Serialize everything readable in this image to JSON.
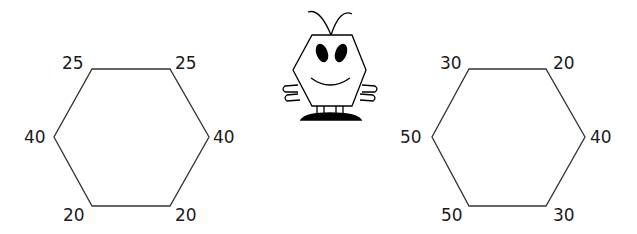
{
  "left_hexagon": {
    "labels": {
      "top_left": "25",
      "top_right": "25",
      "right": "40",
      "bottom_right": "20",
      "bottom_left": "20",
      "left": "40"
    }
  },
  "right_hexagon": {
    "labels": {
      "top_left": "30",
      "top_right": "20",
      "right": "40",
      "bottom_right": "30",
      "bottom_left": "50",
      "left": "50"
    }
  },
  "mascot": {
    "icon": "hexagon-bug-character-icon"
  },
  "colors": {
    "stroke": "#333333",
    "text": "#1a1a1a",
    "fill": "#000000"
  }
}
